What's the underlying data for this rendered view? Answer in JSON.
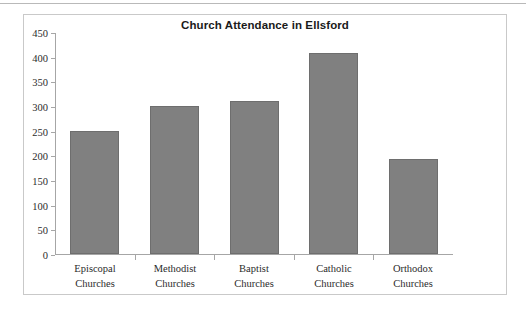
{
  "chart_data": {
    "type": "bar",
    "title": "Church Attendance in Ellsford",
    "xlabel": "",
    "ylabel": "",
    "categories": [
      "Episcopal Churches",
      "Methodist Churches",
      "Baptist Churches",
      "Catholic Churches",
      "Orthodox Churches"
    ],
    "category_lines": [
      [
        "Episcopal",
        "Churches"
      ],
      [
        "Methodist",
        "Churches"
      ],
      [
        "Baptist",
        "Churches"
      ],
      [
        "Catholic",
        "Churches"
      ],
      [
        "Orthodox",
        "Churches"
      ]
    ],
    "values": [
      250,
      300,
      310,
      407,
      192
    ],
    "ylim": [
      0,
      450
    ],
    "ytick_step": 50,
    "yticks": [
      0,
      50,
      100,
      150,
      200,
      250,
      300,
      350,
      400,
      450
    ],
    "ytick_labels": [
      "0",
      "50",
      "100",
      "150",
      "200",
      "250",
      "300",
      "350",
      "400",
      "450"
    ],
    "grid": false,
    "legend": false,
    "bar_color": "#808080",
    "bar_border_color": "#6e6e6e",
    "axis_color": "#a6a6a6",
    "frame_color": "#c9c9c9",
    "title_color": "#1a1a1a",
    "tick_label_color": "#2b2b2b"
  }
}
